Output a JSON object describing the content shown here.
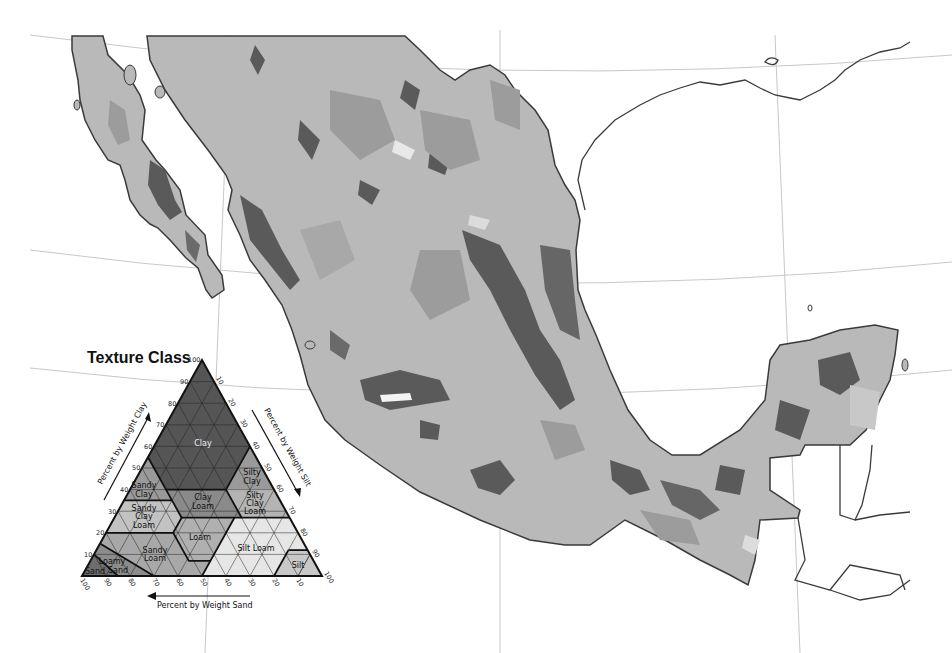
{
  "map": {
    "subject": "Soil texture class map of Mexico",
    "colors": {
      "background": "#ffffff",
      "land_base": "#b9b9b9",
      "land_mid": "#9c9c9c",
      "land_dark": "#5a5a5a",
      "land_light": "#dcdcdc",
      "coastline": "#3a3a3a",
      "graticule": "#c8c8c8"
    }
  },
  "legend": {
    "title": "Texture Class",
    "axes": {
      "clay": "Percent by Weight Clay",
      "silt": "Percent by Weight Silt",
      "sand": "Percent by Weight Sand"
    },
    "clay_ticks": [
      "100",
      "90",
      "80",
      "70",
      "60",
      "50",
      "40",
      "30",
      "20",
      "10"
    ],
    "silt_ticks": [
      "10",
      "20",
      "30",
      "40",
      "50",
      "60",
      "70",
      "80",
      "90",
      "100"
    ],
    "sand_ticks": [
      "100",
      "90",
      "80",
      "70",
      "60",
      "50",
      "40",
      "30",
      "20",
      "10"
    ],
    "classes": [
      {
        "name": "Clay",
        "label": [
          "Clay"
        ],
        "color": "#555555"
      },
      {
        "name": "Sandy Clay",
        "label": [
          "Sandy",
          "Clay"
        ],
        "color": "#9a9a9a"
      },
      {
        "name": "Silty Clay",
        "label": [
          "Silty",
          "Clay"
        ],
        "color": "#9a9a9a"
      },
      {
        "name": "Clay Loam",
        "label": [
          "Clay",
          "Loam"
        ],
        "color": "#8a8a8a"
      },
      {
        "name": "Silty Clay Loam",
        "label": [
          "Silty",
          "Clay",
          "Loam"
        ],
        "color": "#b4b4b4"
      },
      {
        "name": "Sandy Clay Loam",
        "label": [
          "Sandy",
          "Clay",
          "Loam"
        ],
        "color": "#c2c2c2"
      },
      {
        "name": "Loam",
        "label": [
          "Loam"
        ],
        "color": "#b0b0b0"
      },
      {
        "name": "Silt Loam",
        "label": [
          "Silt Loam"
        ],
        "color": "#e6e6e6"
      },
      {
        "name": "Silt",
        "label": [
          "Silt"
        ],
        "color": "#c8c8c8"
      },
      {
        "name": "Sandy Loam",
        "label": [
          "Sandy",
          "Loam"
        ],
        "color": "#a8a8a8"
      },
      {
        "name": "Loamy Sand",
        "label": [
          "Loamy",
          "Sand"
        ],
        "color": "#8c8c8c"
      },
      {
        "name": "Sand",
        "label": [
          "Sand"
        ],
        "color": "#6e6e6e"
      }
    ]
  }
}
